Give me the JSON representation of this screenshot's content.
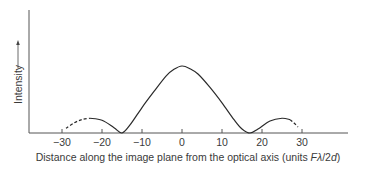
{
  "chart_data": {
    "type": "line",
    "title": "",
    "xlabel": "Distance along the image plane from the optical axis (units Fλ/2d)",
    "xlabel_parts": {
      "prefix": "Distance along the image plane from the optical axis (units ",
      "italic": "Fλ",
      "middle": "/2",
      "italic2": "d",
      "suffix": ")"
    },
    "ylabel": "Intensity",
    "ylabel_arrow": true,
    "xlim": [
      -38,
      42
    ],
    "ylim": [
      0,
      1.2
    ],
    "x_ticks": [
      -30,
      -20,
      -10,
      0,
      10,
      20,
      30
    ],
    "x_tick_labels": [
      "−30",
      "−20",
      "−10",
      "0",
      "10",
      "20",
      "30"
    ],
    "grid": false,
    "legend": null,
    "series": [
      {
        "name": "Intensity profile (solid)",
        "style": "solid",
        "x": [
          -23,
          -20,
          -17,
          -15,
          -13,
          -10,
          -7,
          -4,
          -2,
          0,
          2,
          4,
          7,
          10,
          13,
          15,
          17,
          19,
          22,
          25,
          27
        ],
        "values": [
          0.22,
          0.19,
          0.08,
          0.0,
          0.12,
          0.38,
          0.62,
          0.85,
          0.95,
          1.0,
          0.96,
          0.88,
          0.68,
          0.45,
          0.2,
          0.06,
          0.0,
          0.06,
          0.18,
          0.22,
          0.2
        ]
      },
      {
        "name": "Extrapolated left tail (dashed)",
        "style": "dashed",
        "x": [
          -29,
          -27,
          -25,
          -23
        ],
        "values": [
          0.07,
          0.15,
          0.2,
          0.22
        ]
      },
      {
        "name": "Extrapolated right tail (dashed)",
        "style": "dashed",
        "x": [
          27,
          28,
          29
        ],
        "values": [
          0.2,
          0.15,
          0.09
        ]
      }
    ]
  }
}
